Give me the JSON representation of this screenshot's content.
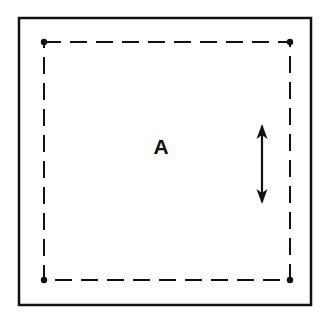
{
  "figure": {
    "background_color": "#ffffff",
    "width": 330,
    "height": 324
  },
  "outer_frame": {
    "name": "outer-frame",
    "shape": "rectangle",
    "stroke_style": "solid",
    "stroke_color": "#111111",
    "stroke_width": 2.5,
    "fill": "none",
    "x": 19,
    "y": 18,
    "width": 292,
    "height": 287
  },
  "dashed_region": {
    "name": "dashed-region",
    "shape": "rectangle",
    "stroke_style": "dashed",
    "stroke_color": "#111111",
    "stroke_width": 2,
    "dash_length": 17,
    "gap_length": 9,
    "fill": "none",
    "x": 44,
    "y": 42,
    "width": 246,
    "height": 238
  },
  "corner_dots": {
    "name": "corner-dots",
    "color": "#111111",
    "radius": 3.2,
    "points": [
      {
        "label": "top-left",
        "x": 44,
        "y": 42
      },
      {
        "label": "top-right",
        "x": 290,
        "y": 42
      },
      {
        "label": "bottom-left",
        "x": 44,
        "y": 280
      },
      {
        "label": "bottom-right",
        "x": 290,
        "y": 280
      }
    ]
  },
  "arrow": {
    "name": "dimension-arrow",
    "orientation": "vertical",
    "heads": "double",
    "color": "#111111",
    "shaft_width": 2.2,
    "head_width": 11,
    "head_length": 15,
    "x": 262,
    "y_top": 124,
    "y_bottom": 204,
    "length": 80
  },
  "labels": [
    {
      "name": "region-label-a",
      "text": "A",
      "x": 161,
      "y": 148,
      "font_size": 21,
      "font_weight": "bold",
      "color": "#111111"
    }
  ],
  "chart_data": {
    "type": "diagram",
    "elements": [
      {
        "kind": "frame",
        "style": "solid",
        "label": ""
      },
      {
        "kind": "region-boundary",
        "style": "dashed",
        "label": "A"
      },
      {
        "kind": "node",
        "style": "filled-dot",
        "count": 4
      },
      {
        "kind": "dimension-arrow",
        "style": "double-headed",
        "direction": "vertical"
      }
    ],
    "annotations": [
      "A"
    ]
  }
}
